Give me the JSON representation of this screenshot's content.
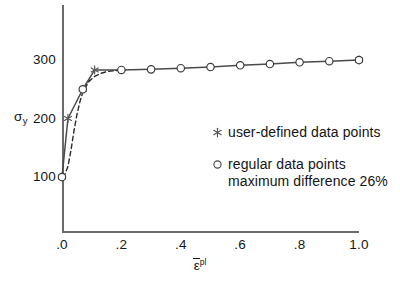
{
  "figure": {
    "background": "#ffffff",
    "caption": ""
  },
  "axes": {
    "y_title": "σ",
    "y_title_sub": "y",
    "x_title_symbol": "ε",
    "x_title_sup": "pl"
  },
  "legend": {
    "position": "inside-right",
    "items": [
      {
        "marker": "asterisk-marker",
        "label": "user-defined data points",
        "label_line2": ""
      },
      {
        "marker": "circle-marker",
        "label": "regular data points",
        "label_line2": "maximum difference 26%"
      }
    ]
  },
  "colors": {
    "axis": "#6b6b6b",
    "solid_line": "#4a4a4a",
    "dashed_line": "#2b2b2b",
    "marker_stroke": "#3a3a3a",
    "marker_fill": "#ffffff",
    "text": "#161616"
  },
  "chart_data": {
    "type": "line",
    "title": "",
    "subtitle": "",
    "xlabel": "ε̄ᵖˡ",
    "ylabel": "σᵧ",
    "xlim": [
      0.0,
      1.0
    ],
    "ylim": [
      0,
      360
    ],
    "grid": false,
    "xticks": [
      0.0,
      0.2,
      0.4,
      0.6,
      0.8,
      1.0
    ],
    "xticklabels": [
      ".0",
      ".2",
      ".4",
      ".6",
      ".8",
      "1.0"
    ],
    "yticks": [
      100,
      200,
      300
    ],
    "yticklabels": [
      "100",
      "200",
      "300"
    ],
    "legend_position": "center-right",
    "annotations": [
      "maximum difference 26%"
    ],
    "series": [
      {
        "name": "piecewise-linear hardening curve",
        "style": "solid",
        "color": "#4a4a4a",
        "x": [
          0.0,
          0.02,
          0.07,
          0.11,
          0.2,
          0.3,
          0.4,
          0.5,
          0.6,
          0.7,
          0.8,
          0.9,
          1.0
        ],
        "y": [
          100,
          200,
          250,
          283,
          283,
          284,
          286,
          288,
          291,
          293,
          296,
          298,
          300
        ]
      },
      {
        "name": "user-defined data points",
        "style": "markers",
        "marker": "asterisk",
        "x": [
          0.0,
          0.02,
          0.07,
          0.11,
          1.0
        ],
        "y": [
          100,
          200,
          250,
          283,
          300
        ]
      },
      {
        "name": "regular data points",
        "style": "markers",
        "marker": "open-circle",
        "x": [
          0.0,
          0.07,
          0.2,
          0.3,
          0.4,
          0.5,
          0.6,
          0.7,
          0.8,
          0.9,
          1.0
        ],
        "y": [
          100,
          250,
          283,
          284,
          286,
          288,
          291,
          293,
          296,
          298,
          300
        ]
      },
      {
        "name": "smooth reference curve",
        "style": "dashed",
        "color": "#2b2b2b",
        "x": [
          0.0,
          0.01,
          0.02,
          0.03,
          0.04,
          0.05,
          0.06,
          0.07,
          0.09,
          0.11,
          0.13,
          0.15,
          0.18,
          0.2
        ],
        "y": [
          100,
          105,
          118,
          145,
          178,
          206,
          228,
          245,
          263,
          272,
          277,
          280,
          282,
          283
        ]
      }
    ]
  }
}
